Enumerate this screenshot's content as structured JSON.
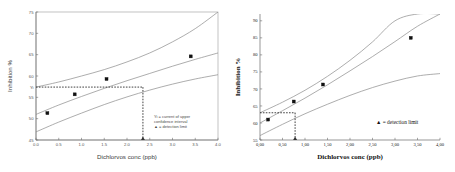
{
  "figure": {
    "panels": [
      "left",
      "right"
    ]
  },
  "chart_data": [
    {
      "id": "left",
      "type": "scatter",
      "title": "",
      "xlabel": "Dichlorvos conc (ppb)",
      "ylabel": "Inhibition %",
      "xlim": [
        0.0,
        4.0
      ],
      "ylim": [
        45,
        75
      ],
      "xticks": [
        "0.0",
        "0.5",
        "1.0",
        "1.5",
        "2.0",
        "2.5",
        "3.0",
        "3.5",
        "4.0"
      ],
      "xtick_values": [
        0.0,
        0.5,
        1.0,
        1.5,
        2.0,
        2.5,
        3.0,
        3.5,
        4.0
      ],
      "yticks": [
        "45",
        "50",
        "55",
        "60",
        "65",
        "70",
        "75"
      ],
      "ytick_values": [
        45,
        50,
        55,
        60,
        65,
        70,
        75
      ],
      "grid": false,
      "frame": "box",
      "points": {
        "name": "measured inhibition",
        "x": [
          0.25,
          0.85,
          1.55,
          3.4
        ],
        "y": [
          51.3,
          55.7,
          59.3,
          64.6
        ]
      },
      "series": [
        {
          "name": "fitted regression line",
          "x": [
            0.0,
            0.5,
            1.0,
            1.5,
            2.0,
            2.5,
            3.0,
            3.5,
            4.0
          ],
          "y": [
            51.0,
            53.2,
            55.2,
            57.1,
            58.9,
            60.6,
            62.3,
            63.9,
            65.4
          ]
        },
        {
          "name": "upper confidence interval",
          "x": [
            0.0,
            0.5,
            1.0,
            1.5,
            2.0,
            2.5,
            3.0,
            3.5,
            4.0
          ],
          "y": [
            57.4,
            58.6,
            60.0,
            61.5,
            63.3,
            65.4,
            68.0,
            71.1,
            75.0
          ]
        },
        {
          "name": "lower confidence interval",
          "x": [
            0.0,
            0.5,
            1.0,
            1.5,
            2.0,
            2.5,
            3.0,
            3.5,
            4.0
          ],
          "y": [
            46.9,
            49.2,
            51.3,
            53.3,
            55.1,
            56.7,
            58.1,
            59.3,
            60.3
          ]
        }
      ],
      "annotations": {
        "yi_tick_label": "Yi",
        "yi_value": 57.4,
        "detection_limit_x": 2.35,
        "horizontal_guide": "dashed line at Yi",
        "vertical_guide": "dashed line at detection limit"
      },
      "legend": {
        "position": "bottom-right",
        "entries": [
          "Yi = current of upper",
          "confidence  interval",
          "▲ = detection limit"
        ]
      }
    },
    {
      "id": "right",
      "type": "scatter",
      "title": "",
      "xlabel": "Dichlorvos conc (ppb)",
      "ylabel": "Inhibition %",
      "xlim": [
        0.0,
        4.0
      ],
      "ylim": [
        55,
        92
      ],
      "xticks": [
        "0,00",
        "0,50",
        "1,00",
        "1,50",
        "2,00",
        "2,50",
        "3,00",
        "3,50",
        "4,00"
      ],
      "xtick_values": [
        0.0,
        0.5,
        1.0,
        1.5,
        2.0,
        2.5,
        3.0,
        3.5,
        4.0
      ],
      "yticks": [
        "55",
        "60",
        "65",
        "70",
        "75",
        "80",
        "85",
        "90"
      ],
      "ytick_values": [
        55,
        60,
        65,
        70,
        75,
        80,
        85,
        90
      ],
      "grid": false,
      "frame": "left-bottom",
      "points": {
        "name": "measured inhibition",
        "x": [
          0.18,
          0.75,
          1.4,
          3.35
        ],
        "y": [
          61.0,
          66.3,
          71.3,
          85.0
        ]
      },
      "series": [
        {
          "name": "fitted regression line",
          "x": [
            0.0,
            0.5,
            1.0,
            1.5,
            2.0,
            2.5,
            3.0,
            3.5,
            4.0
          ],
          "y": [
            60.0,
            63.6,
            67.3,
            71.2,
            75.3,
            79.5,
            83.9,
            88.4,
            92.0
          ]
        },
        {
          "name": "upper confidence interval",
          "x": [
            0.0,
            0.5,
            1.0,
            1.5,
            2.0,
            2.5,
            3.0,
            3.5,
            4.0
          ],
          "y": [
            63.0,
            66.1,
            69.6,
            73.7,
            78.4,
            83.8,
            90.0,
            92.0,
            92.0
          ]
        },
        {
          "name": "lower confidence interval",
          "x": [
            0.0,
            0.5,
            1.0,
            1.5,
            2.0,
            2.5,
            3.0,
            3.5,
            4.0
          ],
          "y": [
            56.3,
            59.6,
            62.7,
            65.5,
            68.1,
            70.4,
            72.3,
            73.8,
            74.5
          ]
        }
      ],
      "annotations": {
        "yi_value": 63.0,
        "detection_limit_x": 0.78,
        "horizontal_guide": "dashed line at Yi",
        "vertical_guide": "dashed line at detection limit"
      },
      "legend": {
        "position": "bottom-right",
        "entries": [
          "▲ = detection limit"
        ]
      }
    }
  ]
}
